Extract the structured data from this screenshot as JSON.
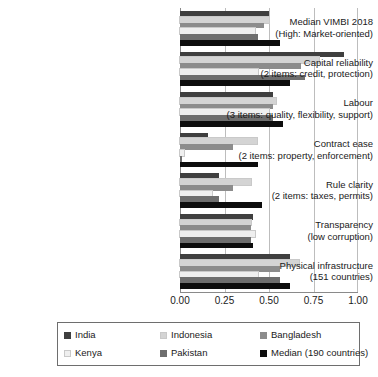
{
  "chart_data": {
    "type": "bar",
    "orientation": "horizontal",
    "title": "",
    "xlabel": "",
    "ylabel": "",
    "xlim": [
      0.0,
      1.0
    ],
    "xticks": [
      "0.00",
      "0.25",
      "0.50",
      "0.75",
      "1.00"
    ],
    "xtick_values": [
      0.0,
      0.25,
      0.5,
      0.75,
      1.0
    ],
    "grid": true,
    "legend_position": "bottom",
    "categories": [
      {
        "line1": "Median VIMBI 2018",
        "line2": "(High: Market-oriented)"
      },
      {
        "line1": "Capital reliability",
        "line2": "(2 items: credit, protection)"
      },
      {
        "line1": "Labour",
        "line2": "(3 items: quality, flexibility, support)"
      },
      {
        "line1": "Contract ease",
        "line2": "(2 items: property, enforcement)"
      },
      {
        "line1": "Rule clarity",
        "line2": "(2 items: taxes, permits)"
      },
      {
        "line1": "Transparency",
        "line2": "(low corruption)"
      },
      {
        "line1": "Physical infrastructure",
        "line2": "(151 countries)"
      }
    ],
    "series": [
      {
        "name": "India",
        "color": "#3f3f3f",
        "values": [
          0.5,
          0.92,
          0.52,
          0.16,
          0.22,
          0.41,
          0.62
        ]
      },
      {
        "name": "Indonesia",
        "color": "#d4d4d4",
        "values": [
          0.5,
          0.78,
          0.54,
          0.43,
          0.4,
          0.4,
          0.67
        ]
      },
      {
        "name": "Bangladesh",
        "color": "#8c8c8c",
        "values": [
          0.47,
          0.68,
          0.52,
          0.3,
          0.3,
          0.4,
          0.56
        ]
      },
      {
        "name": "Kenya",
        "color": "#efefef",
        "values": [
          0.42,
          0.44,
          0.5,
          0.02,
          0.18,
          0.42,
          0.44
        ]
      },
      {
        "name": "Pakistan",
        "color": "#6e6e6e",
        "values": [
          0.44,
          0.7,
          0.52,
          0.01,
          0.22,
          0.4,
          0.56
        ]
      },
      {
        "name": "Median (190 countries)",
        "color": "#0d0d0d",
        "values": [
          0.56,
          0.62,
          0.58,
          0.44,
          0.46,
          0.41,
          0.62
        ]
      }
    ]
  },
  "legend": {
    "entries": [
      {
        "label": "India",
        "color": "#3f3f3f"
      },
      {
        "label": "Indonesia",
        "color": "#d4d4d4"
      },
      {
        "label": "Bangladesh",
        "color": "#8c8c8c"
      },
      {
        "label": "Kenya",
        "color": "#efefef"
      },
      {
        "label": "Pakistan",
        "color": "#6e6e6e"
      },
      {
        "label": "Median (190 countries)",
        "color": "#0d0d0d"
      }
    ]
  }
}
